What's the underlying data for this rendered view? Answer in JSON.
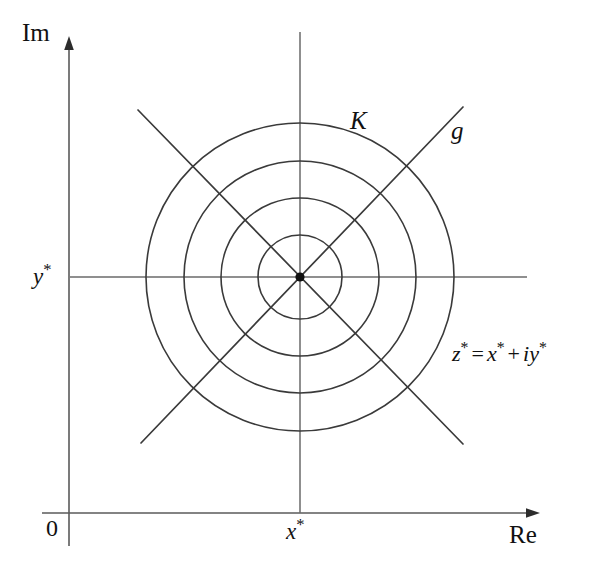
{
  "figure": {
    "background_color": "#ffffff",
    "stroke_color": "#3a3a3a",
    "axis_color": "#4a4a4a",
    "point_color": "#111111",
    "width": 599,
    "height": 572
  },
  "axes": {
    "imaginary_label": "Im",
    "real_label": "Re",
    "origin_label": "0",
    "imaginary_axis_x": 69,
    "real_axis_y": 513,
    "imaginary_arrow_tip_y": 43,
    "real_arrow_tip_x": 536
  },
  "guides": {
    "vertical_label": "x*",
    "vertical_label_base": "x",
    "vertical_label_star": "*",
    "vertical_x": 300,
    "vertical_top_y": 32,
    "horizontal_label": "y*",
    "horizontal_label_base": "y",
    "horizontal_label_star": "*",
    "horizontal_y": 277,
    "horizontal_left_x": 70,
    "horizontal_right_x": 527
  },
  "point": {
    "name": "z-star",
    "x": 300,
    "y": 277,
    "radius": 4.5
  },
  "circles": {
    "label": "K",
    "center_x": 300,
    "center_y": 277,
    "radii": [
      42,
      79,
      116,
      154
    ],
    "count": 4
  },
  "rays": {
    "label": "g",
    "description": "two 45-degree straight lines crossing at z*",
    "segments": [
      {
        "name": "ray-ne-sw",
        "x1": 141,
        "y1": 443,
        "x2": 463,
        "y2": 107
      },
      {
        "name": "ray-nw-se",
        "x1": 138,
        "y1": 110,
        "x2": 463,
        "y2": 444
      }
    ]
  },
  "annotation": {
    "equation_full": "z* = x* + iy*",
    "equation_parts": {
      "lhs_base": "z",
      "lhs_star": "*",
      "equals": "=",
      "rhs1_base": "x",
      "rhs1_star": "*",
      "plus": "+",
      "rhs2_i": "i",
      "rhs2_base": "y",
      "rhs2_star": "*"
    }
  }
}
